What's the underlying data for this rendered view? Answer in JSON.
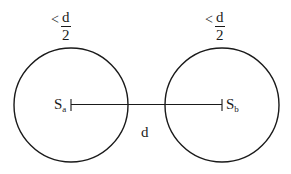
{
  "diagram": {
    "left_circle": {
      "center_label_main": "S",
      "center_label_sub": "a",
      "radius_label": {
        "relation": "<",
        "numerator": "d",
        "denominator": "2"
      },
      "cx": 71,
      "cy": 105,
      "r": 57
    },
    "right_circle": {
      "center_label_main": "S",
      "center_label_sub": "b",
      "radius_label": {
        "relation": "<",
        "numerator": "d",
        "denominator": "2"
      },
      "cx": 222,
      "cy": 105,
      "r": 57
    },
    "distance_label": "d",
    "stroke_color": "#1a1a1a",
    "background": "#ffffff"
  }
}
